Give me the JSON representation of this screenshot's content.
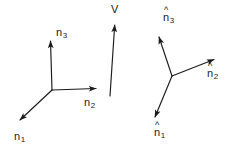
{
  "figure": {
    "background_color": "#ffffff",
    "ink_color": "#1a1a1a",
    "width": 238,
    "height": 158
  },
  "left_frame": {
    "name": "unhatted-basis-triad",
    "origin": {
      "x": 52,
      "y": 90
    },
    "axes": [
      {
        "id": "n1",
        "label_n": "n",
        "label_sub": "1",
        "hat": false,
        "tip": {
          "x": 16,
          "y": 124
        },
        "label_pos": {
          "x": 14,
          "y": 131
        }
      },
      {
        "id": "n2",
        "label_n": "n",
        "label_sub": "2",
        "hat": false,
        "tip": {
          "x": 100,
          "y": 88
        },
        "label_pos": {
          "x": 84,
          "y": 97
        }
      },
      {
        "id": "n3",
        "label_n": "n",
        "label_sub": "3",
        "hat": false,
        "tip": {
          "x": 50,
          "y": 36
        },
        "label_pos": {
          "x": 56,
          "y": 27
        }
      }
    ]
  },
  "middle_vector": {
    "name": "vector-V",
    "label": "V",
    "tail": {
      "x": 110,
      "y": 96
    },
    "tip": {
      "x": 115,
      "y": 20
    },
    "label_pos": {
      "x": 111,
      "y": 4
    }
  },
  "right_frame": {
    "name": "hatted-basis-triad",
    "origin": {
      "x": 172,
      "y": 76
    },
    "axes": [
      {
        "id": "nhat1",
        "label_n": "n",
        "label_sub": "1",
        "hat": true,
        "tip": {
          "x": 152,
          "y": 122
        },
        "label_pos": {
          "x": 154,
          "y": 127
        }
      },
      {
        "id": "nhat2",
        "label_n": "n",
        "label_sub": "2",
        "hat": true,
        "tip": {
          "x": 219,
          "y": 57
        },
        "label_pos": {
          "x": 207,
          "y": 68
        }
      },
      {
        "id": "nhat3",
        "label_n": "n",
        "label_sub": "3",
        "hat": true,
        "tip": {
          "x": 157,
          "y": 32
        },
        "label_pos": {
          "x": 163,
          "y": 12
        }
      }
    ]
  },
  "glyphs": {
    "hat": "^"
  }
}
